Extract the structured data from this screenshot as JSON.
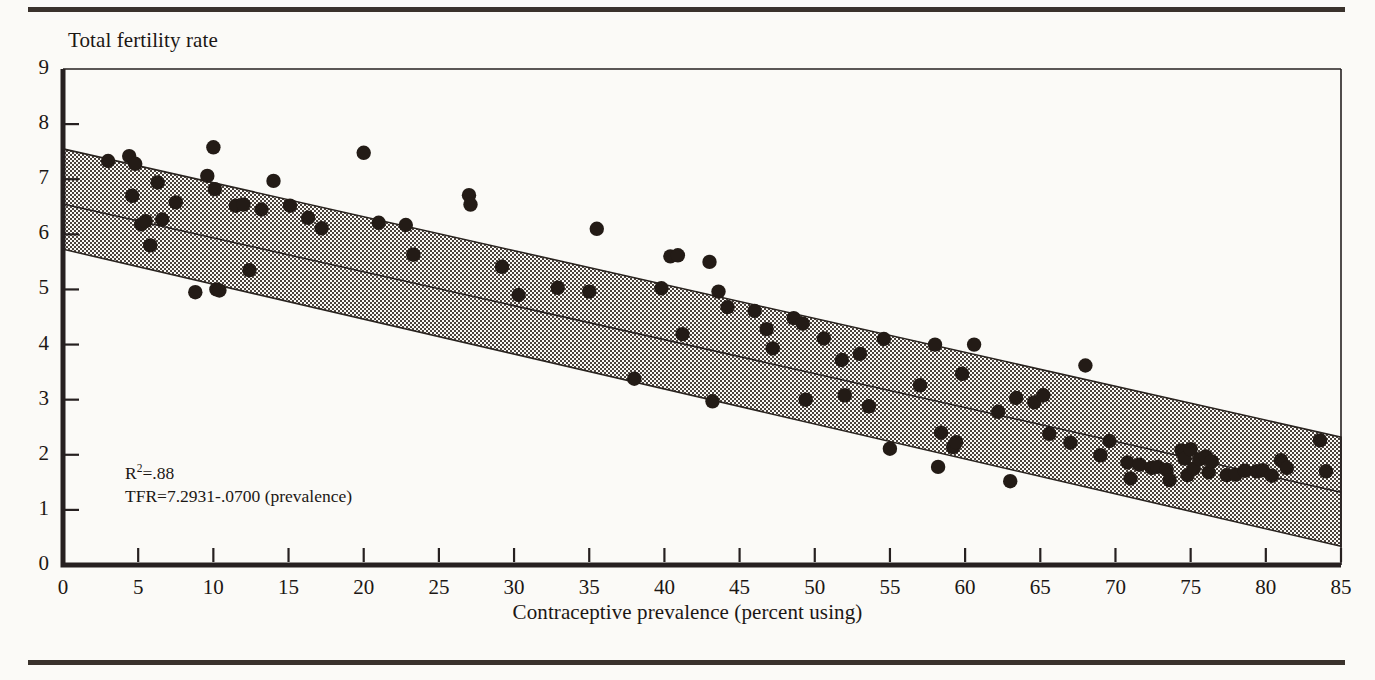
{
  "figure": {
    "background_color": "#fbfaf7",
    "rule_color": "#3a322c",
    "axis_color": "#262020",
    "point_color": "#231b16",
    "band_fill_color": "#b8b4ad",
    "band_edge_color": "#2a2420"
  },
  "annotation": {
    "r_squared_prefix": "R",
    "r_squared_exponent": "2",
    "r_squared_value": "=.88",
    "equation": "TFR=7.2931-.0700 (prevalence)"
  },
  "chart_data": {
    "type": "scatter",
    "title": "",
    "xlabel": "Contraceptive prevalence (percent using)",
    "ylabel": "Total fertility rate",
    "xlim": [
      0,
      85
    ],
    "ylim": [
      0,
      9
    ],
    "xticks": [
      0,
      5,
      10,
      15,
      20,
      25,
      30,
      35,
      40,
      45,
      50,
      55,
      60,
      65,
      70,
      75,
      80,
      85
    ],
    "yticks": [
      0,
      1,
      2,
      3,
      4,
      5,
      6,
      7,
      8,
      9
    ],
    "xtick_labels": [
      "0",
      "5",
      "10",
      "15",
      "20",
      "25",
      "30",
      "35",
      "40",
      "45",
      "50",
      "55",
      "60",
      "65",
      "70",
      "75",
      "80",
      "85"
    ],
    "ytick_labels": [
      "0",
      "1",
      "2",
      "3",
      "4",
      "5",
      "6",
      "7",
      "8",
      "9"
    ],
    "grid": false,
    "legend": null,
    "r_squared": 0.88,
    "regression": {
      "intercept": 7.2931,
      "slope": -0.07,
      "equation_text": "TFR=7.2931-.0700 (prevalence)",
      "line_x": [
        0,
        85
      ],
      "line_y": [
        6.55,
        1.32
      ]
    },
    "confidence_band": {
      "label": "prediction interval",
      "x": [
        0,
        85
      ],
      "upper_y": [
        7.55,
        2.32
      ],
      "lower_y": [
        5.73,
        0.34
      ]
    },
    "series": [
      {
        "name": "Countries",
        "marker": "circle",
        "points": [
          [
            3.0,
            7.33
          ],
          [
            4.4,
            7.42
          ],
          [
            4.6,
            6.7
          ],
          [
            4.8,
            7.28
          ],
          [
            5.2,
            6.18
          ],
          [
            5.5,
            6.24
          ],
          [
            5.8,
            5.8
          ],
          [
            6.3,
            6.94
          ],
          [
            6.6,
            6.27
          ],
          [
            7.5,
            6.58
          ],
          [
            8.8,
            4.95
          ],
          [
            9.6,
            7.06
          ],
          [
            10.0,
            7.58
          ],
          [
            10.1,
            6.82
          ],
          [
            10.2,
            5.0
          ],
          [
            10.4,
            4.98
          ],
          [
            11.5,
            6.52
          ],
          [
            12.0,
            6.54
          ],
          [
            12.4,
            5.35
          ],
          [
            13.2,
            6.45
          ],
          [
            14.0,
            6.97
          ],
          [
            15.1,
            6.52
          ],
          [
            16.3,
            6.3
          ],
          [
            17.2,
            6.11
          ],
          [
            20.0,
            7.48
          ],
          [
            21.0,
            6.21
          ],
          [
            22.8,
            6.17
          ],
          [
            23.3,
            5.63
          ],
          [
            27.0,
            6.71
          ],
          [
            27.1,
            6.54
          ],
          [
            29.2,
            5.41
          ],
          [
            30.3,
            4.9
          ],
          [
            32.9,
            5.03
          ],
          [
            35.0,
            4.96
          ],
          [
            35.5,
            6.1
          ],
          [
            38.0,
            3.38
          ],
          [
            39.8,
            5.02
          ],
          [
            40.4,
            5.6
          ],
          [
            40.9,
            5.62
          ],
          [
            41.2,
            4.19
          ],
          [
            43.0,
            5.5
          ],
          [
            43.2,
            2.97
          ],
          [
            43.6,
            4.96
          ],
          [
            44.2,
            4.68
          ],
          [
            46.0,
            4.61
          ],
          [
            46.8,
            4.28
          ],
          [
            47.2,
            3.93
          ],
          [
            48.6,
            4.48
          ],
          [
            49.2,
            4.38
          ],
          [
            49.4,
            3.0
          ],
          [
            50.6,
            4.11
          ],
          [
            51.8,
            3.72
          ],
          [
            52.0,
            3.08
          ],
          [
            53.0,
            3.83
          ],
          [
            53.6,
            2.88
          ],
          [
            54.6,
            4.1
          ],
          [
            55.0,
            2.11
          ],
          [
            57.0,
            3.26
          ],
          [
            58.0,
            4.0
          ],
          [
            58.2,
            1.78
          ],
          [
            58.4,
            2.4
          ],
          [
            59.2,
            2.14
          ],
          [
            59.4,
            2.23
          ],
          [
            59.8,
            3.47
          ],
          [
            60.6,
            4.0
          ],
          [
            62.2,
            2.78
          ],
          [
            63.0,
            1.52
          ],
          [
            63.4,
            3.03
          ],
          [
            64.6,
            2.95
          ],
          [
            65.2,
            3.08
          ],
          [
            65.6,
            2.38
          ],
          [
            67.0,
            2.22
          ],
          [
            68.0,
            3.62
          ],
          [
            69.0,
            1.99
          ],
          [
            69.6,
            2.25
          ],
          [
            70.8,
            1.86
          ],
          [
            71.0,
            1.57
          ],
          [
            71.6,
            1.82
          ],
          [
            72.4,
            1.76
          ],
          [
            72.8,
            1.78
          ],
          [
            73.4,
            1.73
          ],
          [
            73.6,
            1.54
          ],
          [
            74.4,
            2.08
          ],
          [
            74.6,
            1.93
          ],
          [
            74.8,
            1.63
          ],
          [
            75.0,
            2.1
          ],
          [
            75.2,
            1.75
          ],
          [
            75.6,
            1.92
          ],
          [
            76.0,
            1.97
          ],
          [
            76.2,
            1.68
          ],
          [
            76.4,
            1.88
          ],
          [
            77.4,
            1.63
          ],
          [
            78.0,
            1.64
          ],
          [
            78.6,
            1.71
          ],
          [
            79.4,
            1.7
          ],
          [
            79.8,
            1.72
          ],
          [
            80.4,
            1.62
          ],
          [
            81.0,
            1.9
          ],
          [
            81.4,
            1.76
          ],
          [
            83.6,
            2.26
          ],
          [
            84.0,
            1.7
          ]
        ]
      }
    ]
  }
}
